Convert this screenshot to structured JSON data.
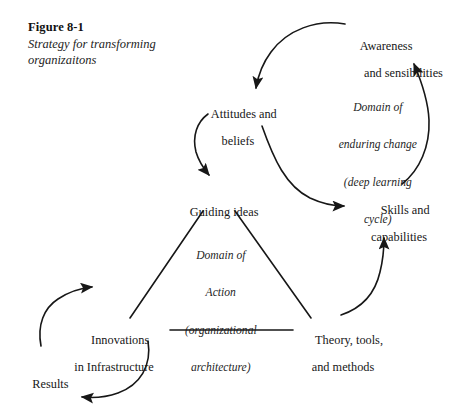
{
  "figure": {
    "number": "Figure 8-1",
    "subtitle_line1": "Strategy for transforming",
    "subtitle_line2": "organizaitons"
  },
  "nodes": {
    "attitudes": {
      "line1": "Attitudes and",
      "line2": "beliefs"
    },
    "awareness": {
      "line1": "Awareness",
      "line2": "and sensibilities"
    },
    "guiding": {
      "line1": "Guiding ideas",
      "line2": ""
    },
    "skills": {
      "line1": "Skills and",
      "line2": "capabilities"
    },
    "innovations": {
      "line1": "Innovations",
      "line2": "in Infrastructure"
    },
    "theory": {
      "line1": "Theory, tools,",
      "line2": "and methods"
    },
    "results": {
      "line1": "Results",
      "line2": ""
    }
  },
  "annotations": {
    "enduring": {
      "line1": "Domain of",
      "line2": "enduring change",
      "line3": "(deep learning",
      "line4": "cycle)"
    },
    "action": {
      "line1": "Domain of",
      "line2": "Action",
      "line3": "(organizational",
      "line4": "architecture)"
    }
  },
  "style": {
    "ink": "#171717",
    "background": "#ffffff",
    "stroke_width": "1.6"
  },
  "diagram": {
    "type": "causal-loop-diagram",
    "edges": [
      {
        "name": "awareness-to-attitudes",
        "from": "awareness",
        "to": "attitudes",
        "shape": "arc",
        "arrow": true
      },
      {
        "name": "attitudes-to-skills",
        "from": "attitudes",
        "to": "skills",
        "shape": "arc",
        "arrow": true
      },
      {
        "name": "skills-to-awareness",
        "from": "skills",
        "to": "awareness",
        "shape": "arc",
        "arrow": true
      },
      {
        "name": "attitudes-to-guiding",
        "from": "attitudes",
        "to": "guiding",
        "shape": "arc",
        "arrow": true
      },
      {
        "name": "theory-to-skills",
        "from": "theory",
        "to": "skills",
        "shape": "arc",
        "arrow": true
      },
      {
        "name": "innovations-to-results",
        "from": "innovations",
        "to": "results",
        "shape": "arc",
        "arrow": true
      },
      {
        "name": "results-to-innovations",
        "from": "results",
        "to": "innovations",
        "shape": "arc",
        "arrow": true
      },
      {
        "name": "guiding-to-innovations",
        "from": "guiding",
        "to": "innovations",
        "shape": "line",
        "arrow": false
      },
      {
        "name": "guiding-to-theory",
        "from": "guiding",
        "to": "theory",
        "shape": "line",
        "arrow": false
      },
      {
        "name": "innovations-to-theory",
        "from": "innovations",
        "to": "theory",
        "shape": "line",
        "arrow": false
      }
    ]
  }
}
